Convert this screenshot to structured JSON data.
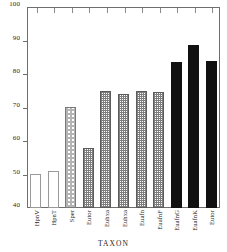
{
  "chart_data": {
    "type": "bar",
    "title": "",
    "xlabel": "TAXON",
    "ylabel": "",
    "ylim": [
      40,
      100
    ],
    "yticks": [
      40,
      50,
      60,
      70,
      80,
      90,
      100
    ],
    "grid": false,
    "legend": "none",
    "categories": [
      "HpnV",
      "HpnT",
      "Sper",
      "Eutor",
      "Euhxa",
      "Euhxa",
      "Euafn",
      "EuafnF",
      "EuafnG",
      "EuafnK",
      "Eutor"
    ],
    "values": [
      50.3,
      51.0,
      70.3,
      58.0,
      75.0,
      74.0,
      75.0,
      74.5,
      83.5,
      88.8,
      84.0
    ],
    "bar_styles": [
      "white",
      "white",
      "hatch",
      "gray",
      "gray",
      "gray",
      "gray",
      "gray",
      "black",
      "black",
      "black"
    ],
    "series": [
      {
        "name": "value",
        "values": [
          50.3,
          51.0,
          70.3,
          58.0,
          75.0,
          74.0,
          75.0,
          74.5,
          83.5,
          88.8,
          84.0
        ]
      }
    ]
  },
  "axis": {
    "x_title": "TAXON",
    "y_tick_labels": [
      "100",
      "90",
      "80",
      "70",
      "60",
      "50",
      "40"
    ]
  },
  "colors": {
    "frame": "#6e6e6e",
    "black_bar": "#111111",
    "gray_bar": "#7e7e7e",
    "hatch_bar": "#b4b4b4",
    "white_bar": "#ffffff",
    "text": "#232323"
  }
}
